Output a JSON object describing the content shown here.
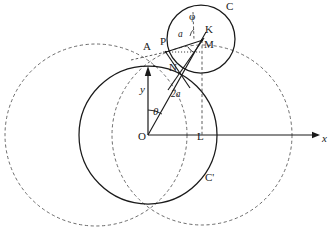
{
  "figure": {
    "type": "geometric-diagram",
    "width": 335,
    "height": 238,
    "stroke_color": "#1a1a1a",
    "background": "#ffffff"
  },
  "axes": {
    "x_label": "x",
    "y_label": "y",
    "origin_label": "O",
    "x_axis": {
      "x1": 148,
      "y1": 135,
      "x2": 320,
      "y2": 135
    },
    "y_axis": {
      "x1": 148,
      "y1": 135,
      "x2": 148,
      "y2": 68
    }
  },
  "points": [
    {
      "name": "O",
      "label": "O",
      "x": 148,
      "y": 135,
      "label_x": 139,
      "label_y": 137
    },
    {
      "name": "A",
      "label": "A",
      "x": 155,
      "y": 66,
      "label_x": 144,
      "label_y": 47
    },
    {
      "name": "P",
      "label": "P",
      "x": 166,
      "y": 52,
      "label_x": 161,
      "label_y": 42
    },
    {
      "name": "K",
      "label": "K",
      "x": 202,
      "y": 40,
      "label_x": 206,
      "label_y": 29
    },
    {
      "name": "M",
      "label": "M",
      "x": 202,
      "y": 52,
      "label_x": 205,
      "label_y": 44
    },
    {
      "name": "N",
      "label": "N",
      "x": 179,
      "y": 73,
      "label_x": 171,
      "label_y": 68
    },
    {
      "name": "L",
      "label": "L",
      "x": 202,
      "y": 135,
      "label_x": 198,
      "label_y": 137
    }
  ],
  "curve_labels": [
    {
      "name": "circle-C-label",
      "label": "C",
      "x": 226,
      "y": 3
    },
    {
      "name": "circle-C-prime-label",
      "label": "C'",
      "x": 206,
      "y": 176
    }
  ],
  "measure_labels": [
    {
      "name": "angle-phi-label",
      "label": "φ",
      "x": 190,
      "y": 15
    },
    {
      "name": "angle-theta-label",
      "label": "θ",
      "x": 153,
      "y": 110
    },
    {
      "name": "segment-a-label",
      "label": "a",
      "x": 178,
      "y": 33
    },
    {
      "name": "segment-2a-label",
      "label": "2a",
      "x": 172,
      "y": 94
    },
    {
      "name": "axis-y-label",
      "label": "y",
      "x": 141,
      "y": 88
    },
    {
      "name": "axis-x-label",
      "label": "x",
      "x": 322,
      "y": 137
    }
  ],
  "circles": [
    {
      "name": "circle-C",
      "cx": 201,
      "cy": 39,
      "r": 34,
      "style": "solid"
    },
    {
      "name": "circle-C-prime",
      "cx": 148,
      "cy": 135,
      "r": 69,
      "style": "solid"
    },
    {
      "name": "circle-dashed-left",
      "cx": 96,
      "cy": 135,
      "r": 91,
      "style": "dashed"
    },
    {
      "name": "circle-dashed-right",
      "cx": 202,
      "cy": 135,
      "r": 90,
      "style": "dashed"
    }
  ],
  "segments": [
    {
      "name": "segment-O-K",
      "x1": 148,
      "y1": 135,
      "x2": 202,
      "y2": 40,
      "style": "solid"
    },
    {
      "name": "segment-P-K",
      "x1": 166,
      "y1": 52,
      "x2": 202,
      "y2": 40,
      "style": "solid"
    },
    {
      "name": "segment-P-N",
      "x1": 166,
      "y1": 52,
      "x2": 186,
      "y2": 82,
      "style": "solid"
    },
    {
      "name": "segment-K-N",
      "x1": 202,
      "y1": 40,
      "x2": 172,
      "y2": 88,
      "style": "solid"
    },
    {
      "name": "segment-P-M-dotted",
      "x1": 163,
      "y1": 52,
      "x2": 202,
      "y2": 52,
      "style": "dotted"
    },
    {
      "name": "segment-A-P-dashed",
      "x1": 134,
      "y1": 59,
      "x2": 166,
      "y2": 52,
      "style": "dashed"
    },
    {
      "name": "segment-K-L-dashed",
      "x1": 202,
      "y1": 40,
      "x2": 202,
      "y2": 135,
      "style": "dashed"
    },
    {
      "name": "segment-K-phi-dashed",
      "x1": 193,
      "y1": 10,
      "x2": 193,
      "y2": 40,
      "style": "dashed"
    }
  ]
}
